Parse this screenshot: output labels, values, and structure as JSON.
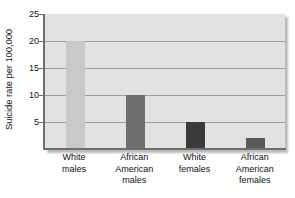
{
  "chart_data": {
    "type": "bar",
    "title": "",
    "xlabel": "",
    "ylabel": "Suicide rate per 100,000",
    "ylim": [
      0,
      25
    ],
    "yticks": [
      5,
      10,
      15,
      20,
      25
    ],
    "ytick_labels": [
      "5",
      "10",
      "15",
      "20",
      "25"
    ],
    "grid": "horizontal",
    "legend": "none",
    "categories": [
      [
        "White",
        "males"
      ],
      [
        "African",
        "American",
        "males"
      ],
      [
        "White",
        "females"
      ],
      [
        "African",
        "American",
        "females"
      ]
    ],
    "category_labels": [
      "White males",
      "African American males",
      "White females",
      "African American females"
    ],
    "values": [
      20,
      10,
      5,
      2
    ],
    "bar_colors": [
      "#c9c9c9",
      "#6e6e6e",
      "#3b3b3b",
      "#585858"
    ],
    "plot_background": "#e2e2e2",
    "gridline_color": "#9e9e9e",
    "axis_color": "#6d6d6d",
    "text_color": "#111111"
  }
}
